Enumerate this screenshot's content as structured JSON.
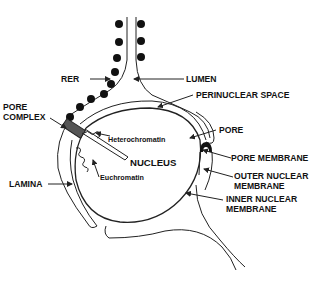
{
  "diagram": {
    "type": "nuclear envelope schematic",
    "labels": {
      "rer": "RER",
      "lumen": "LUMEN",
      "perinuclear_space": "PERINUCLEAR SPACE",
      "pore": "PORE",
      "pore_complex_1": "PORE",
      "pore_complex_2": "COMPLEX",
      "heterochromatin": "Heterochromatin",
      "nucleus": "NUCLEUS",
      "euchromatin": "Euchromatin",
      "pore_membrane": "PORE MEMBRANE",
      "outer_nuclear_membrane_1": "OUTER NUCLEAR",
      "outer_nuclear_membrane_2": "MEMBRANE",
      "inner_nuclear_membrane_1": "INNER NUCLEAR",
      "inner_nuclear_membrane_2": "MEMBRANE",
      "lamina": "LAMINA"
    },
    "colors": {
      "line": "#222222",
      "ribosome": "#111111",
      "pore_complex": "#555555",
      "background": "#ffffff"
    }
  }
}
